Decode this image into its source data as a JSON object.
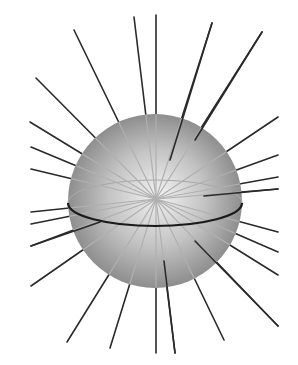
{
  "diagram": {
    "colors": {
      "background": "#ffffff",
      "sphere_highlight": "#f2f2f2",
      "sphere_mid": "#c4c4c4",
      "sphere_edge": "#8e8e8e",
      "line_outside": "#2a2a2a",
      "line_inside": "#b0b0b0",
      "equator_front": "#1a1a1a",
      "equator_back": "#a8a8a8"
    },
    "sphere": {
      "cx": 155,
      "cy": 201,
      "r": 87
    },
    "center_point": {
      "x": 156,
      "y": 199
    },
    "equator": {
      "cx": 155,
      "cy": 203,
      "rx": 87,
      "ry": 23
    },
    "outer_lines": [
      {
        "x1": 156,
        "y1": 199,
        "x2": 74,
        "y2": 30
      },
      {
        "x1": 156,
        "y1": 199,
        "x2": 134,
        "y2": 17
      },
      {
        "x1": 156,
        "y1": 199,
        "x2": 156,
        "y2": 15
      },
      {
        "x1": 170,
        "y1": 160,
        "x2": 212,
        "y2": 23
      },
      {
        "x1": 195,
        "y1": 140,
        "x2": 262,
        "y2": 32
      },
      {
        "x1": 156,
        "y1": 199,
        "x2": 36,
        "y2": 78
      },
      {
        "x1": 156,
        "y1": 199,
        "x2": 30,
        "y2": 122
      },
      {
        "x1": 156,
        "y1": 199,
        "x2": 31,
        "y2": 147
      },
      {
        "x1": 156,
        "y1": 199,
        "x2": 31,
        "y2": 169
      },
      {
        "x1": 156,
        "y1": 199,
        "x2": 31,
        "y2": 212
      },
      {
        "x1": 156,
        "y1": 199,
        "x2": 31,
        "y2": 224
      },
      {
        "x1": 100,
        "y1": 222,
        "x2": 31,
        "y2": 246
      },
      {
        "x1": 156,
        "y1": 199,
        "x2": 31,
        "y2": 286
      },
      {
        "x1": 156,
        "y1": 199,
        "x2": 67,
        "y2": 342
      },
      {
        "x1": 156,
        "y1": 199,
        "x2": 110,
        "y2": 348
      },
      {
        "x1": 156,
        "y1": 199,
        "x2": 156,
        "y2": 353
      },
      {
        "x1": 164,
        "y1": 261,
        "x2": 175,
        "y2": 353
      },
      {
        "x1": 156,
        "y1": 199,
        "x2": 224,
        "y2": 340
      },
      {
        "x1": 195,
        "y1": 241,
        "x2": 278,
        "y2": 326
      },
      {
        "x1": 156,
        "y1": 199,
        "x2": 278,
        "y2": 275
      },
      {
        "x1": 156,
        "y1": 199,
        "x2": 278,
        "y2": 252
      },
      {
        "x1": 156,
        "y1": 199,
        "x2": 278,
        "y2": 232
      },
      {
        "x1": 204,
        "y1": 196,
        "x2": 278,
        "y2": 189
      },
      {
        "x1": 156,
        "y1": 199,
        "x2": 278,
        "y2": 177
      },
      {
        "x1": 156,
        "y1": 199,
        "x2": 278,
        "y2": 155
      },
      {
        "x1": 156,
        "y1": 199,
        "x2": 278,
        "y2": 117
      }
    ]
  }
}
